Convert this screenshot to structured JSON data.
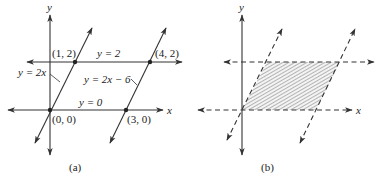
{
  "panels": [
    {
      "id": "a",
      "caption": "(a)",
      "axes": {
        "x_label": "x",
        "y_label": "y"
      },
      "lines": [
        {
          "equation": "y = 2",
          "style": "solid"
        },
        {
          "equation": "y = 0",
          "style": "solid"
        },
        {
          "equation": "y = 2x",
          "style": "solid"
        },
        {
          "equation": "y = 2x − 6",
          "style": "solid"
        }
      ],
      "points": [
        {
          "label": "(0, 0)",
          "x": 0,
          "y": 0
        },
        {
          "label": "(1, 2)",
          "x": 1,
          "y": 2
        },
        {
          "label": "(4, 2)",
          "x": 4,
          "y": 2
        },
        {
          "label": "(3, 0)",
          "x": 3,
          "y": 0
        }
      ]
    },
    {
      "id": "b",
      "caption": "(b)",
      "axes": {
        "x_label": "x",
        "y_label": "y"
      },
      "lines_style": "dashed",
      "shaded_region": "parallelogram with vertices (0,0), (1,2), (4,2), (3,0)",
      "shade_color": "#9a9a9a"
    }
  ],
  "colors": {
    "ink": "#333333",
    "background": "#ffffff"
  }
}
